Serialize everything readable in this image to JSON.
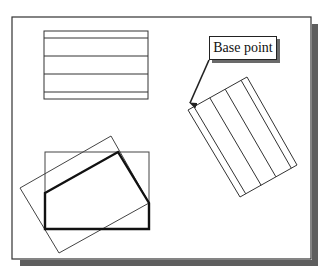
{
  "diagram": {
    "type": "cad-rotate-illustration",
    "callout": {
      "label": "Base point"
    },
    "frame": {
      "x": 12,
      "y": 17,
      "width": 299,
      "height": 242,
      "shadow_color": "#5a5a5a",
      "stroke": "#333333"
    },
    "shapes": {
      "top_rectangle": {
        "x": 44,
        "y": 31,
        "width": 104,
        "height": 68,
        "inner_lines_y": [
          38,
          56,
          74,
          92
        ]
      },
      "rotated_rectangle": {
        "corners": [
          [
            188,
            110
          ],
          [
            247,
            77
          ],
          [
            297,
            165
          ],
          [
            240,
            197
          ]
        ],
        "inner_line_fractions": [
          0.1,
          0.37,
          0.63,
          0.9
        ]
      },
      "bottom_axis_rectangle": {
        "x": 45,
        "y": 152,
        "width": 104,
        "height": 77
      },
      "bottom_rotated_rectangle": {
        "corners": [
          [
            111,
            136
          ],
          [
            149,
            203
          ],
          [
            59,
            253
          ],
          [
            20,
            188
          ]
        ]
      },
      "thick_polygon": {
        "points": [
          [
            45,
            193
          ],
          [
            118,
            152
          ],
          [
            149,
            203
          ],
          [
            149,
            229
          ],
          [
            45,
            229
          ]
        ]
      },
      "arrow": {
        "from": [
          209,
          60
        ],
        "to": [
          189,
          105
        ]
      }
    },
    "colors": {
      "line": "#333333",
      "thick_line": "#111111",
      "shadow": "#5e5e5e",
      "background": "#ffffff"
    }
  }
}
